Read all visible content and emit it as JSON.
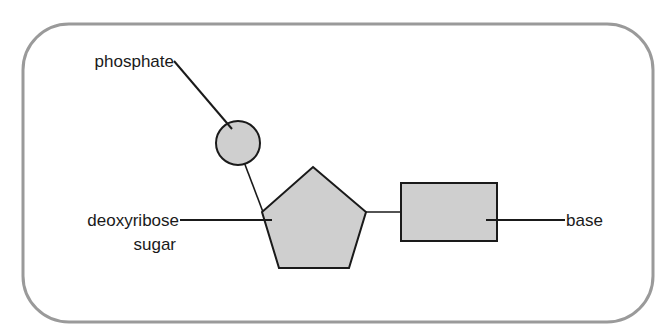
{
  "diagram": {
    "labels": {
      "phosphate": "phosphate",
      "sugar_line1": "deoxyribose",
      "sugar_line2": "sugar",
      "base": "base"
    },
    "colors": {
      "frame": "#9a9a9a",
      "shape_fill": "#cfcfcf",
      "stroke": "#1a1a1a",
      "background": "#ffffff"
    },
    "components": [
      {
        "name": "phosphate",
        "shape": "circle"
      },
      {
        "name": "deoxyribose sugar",
        "shape": "pentagon"
      },
      {
        "name": "base",
        "shape": "rectangle"
      }
    ]
  }
}
